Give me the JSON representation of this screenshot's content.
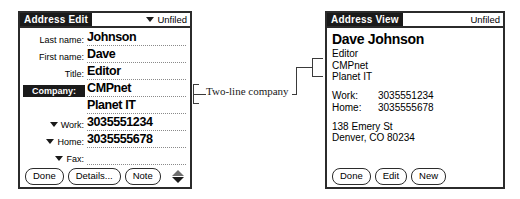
{
  "edit_panel": {
    "title": "Address Edit",
    "category": "Unfiled",
    "category_icon": "chevron-down-icon",
    "fields": [
      {
        "label": "Last name:",
        "value": "Johnson",
        "selected": false,
        "has_triangle": false
      },
      {
        "label": "First name:",
        "value": "Dave",
        "selected": false,
        "has_triangle": false
      },
      {
        "label": "Title:",
        "value": "Editor",
        "selected": false,
        "has_triangle": false
      },
      {
        "label": "Company:",
        "value": "CMPnet",
        "selected": true,
        "has_triangle": false
      },
      {
        "label": "",
        "value": "Planet IT",
        "selected": false,
        "has_triangle": false
      },
      {
        "label": "Work:",
        "value": "3035551234",
        "selected": false,
        "has_triangle": true
      },
      {
        "label": "Home:",
        "value": "3035555678",
        "selected": false,
        "has_triangle": true
      },
      {
        "label": "Fax:",
        "value": "",
        "selected": false,
        "has_triangle": true
      }
    ],
    "buttons": [
      {
        "label": "Done"
      },
      {
        "label": "Details..."
      },
      {
        "label": "Note"
      }
    ],
    "scroll_up_icon": "scroll-up-arrow-icon",
    "scroll_down_icon": "scroll-down-arrow-icon"
  },
  "view_panel": {
    "title": "Address View",
    "category": "Unfiled",
    "name": "Dave Johnson",
    "detail_lines": [
      "Editor",
      "CMPnet",
      "Planet IT"
    ],
    "phones": [
      {
        "label": "Work:",
        "number": "3035551234"
      },
      {
        "label": "Home:",
        "number": "3035555678"
      }
    ],
    "address_lines": [
      "138 Emery St",
      "Denver, CO  80234"
    ],
    "buttons": [
      {
        "label": "Done"
      },
      {
        "label": "Edit"
      },
      {
        "label": "New"
      }
    ]
  },
  "annotation": {
    "text": "Two-line company"
  },
  "colors": {
    "ink": "#1a1a1a",
    "frame": "#2b2b2b",
    "dotted_rule": "#8a8a8a",
    "background": "#ffffff"
  }
}
